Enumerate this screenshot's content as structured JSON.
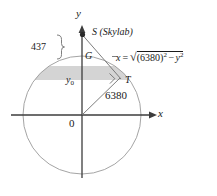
{
  "figure": {
    "axes": {
      "y_label": "y",
      "x_label": "x",
      "origin_label": "0"
    },
    "points": {
      "s_label": "S (Skylab)",
      "g_label": "G",
      "t_label": "T"
    },
    "measures": {
      "altitude": "437",
      "radius": "6380",
      "y_naught": "y",
      "y_naught_sub": "0"
    },
    "equation": {
      "lhs": "x",
      "eq": "=",
      "radicand_open": "(",
      "radicand_radius": "6380",
      "radicand_close": ")",
      "radicand_exp": "2",
      "minus": "−",
      "var": "y",
      "var_exp": "2"
    },
    "colors": {
      "stroke": "#8a8a8a",
      "axis": "#4a4a4a",
      "shade": "#d4d4d4",
      "text": "#1a1a1a"
    }
  }
}
